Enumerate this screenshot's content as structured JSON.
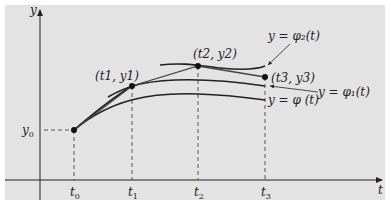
{
  "diagram": {
    "axes": {
      "x_label": "t",
      "y_label": "y"
    },
    "ticks": {
      "t": [
        {
          "base": "t",
          "sub": "0"
        },
        {
          "base": "t",
          "sub": "1"
        },
        {
          "base": "t",
          "sub": "2"
        },
        {
          "base": "t",
          "sub": "3"
        }
      ],
      "y0": {
        "base": "y",
        "sub": "0"
      }
    },
    "points": [
      {
        "name": "t0-y0",
        "label": ""
      },
      {
        "name": "t1-y1",
        "label": "(t1, y1)"
      },
      {
        "name": "t2-y2",
        "label": "(t2, y2)"
      },
      {
        "name": "t3-y3",
        "label": "(t3, y3)"
      }
    ],
    "curves": {
      "phi": {
        "label": "y = φ (t)"
      },
      "phi1": {
        "label": "y = φ₁(t)"
      },
      "phi2": {
        "label": "y = φ₂(t)"
      }
    },
    "colors": {
      "panel": "#e3e3e3",
      "ink": "#222222"
    }
  }
}
